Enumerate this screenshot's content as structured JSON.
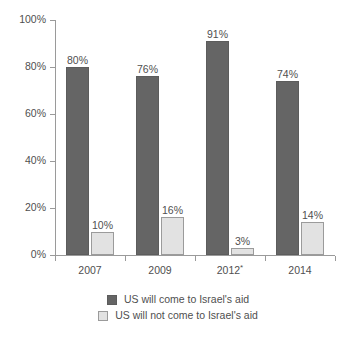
{
  "chart_data": {
    "type": "bar",
    "title": "",
    "subtitle": "",
    "xlabel": "",
    "ylabel": "",
    "ylim": [
      0,
      100
    ],
    "ytick_labels": [
      "0%",
      "20%",
      "40%",
      "60%",
      "80%",
      "100%"
    ],
    "ytick_values": [
      0,
      20,
      40,
      60,
      80,
      100
    ],
    "grid": false,
    "legend_position": "bottom",
    "categories": [
      "2007",
      "2009",
      "2012*",
      "2014"
    ],
    "series": [
      {
        "name": "US will come to Israel's aid",
        "color": "#656565",
        "values": [
          80,
          76,
          91,
          74
        ],
        "value_labels": [
          "80%",
          "76%",
          "91%",
          "74%"
        ]
      },
      {
        "name": "US will not come to Israel's aid",
        "color": "#e2e2e2",
        "values": [
          10,
          16,
          3,
          14
        ],
        "value_labels": [
          "10%",
          "16%",
          "3%",
          "14%"
        ]
      }
    ]
  },
  "legend": {
    "items": [
      {
        "label": "US will come to Israel's aid",
        "swatch": "dark"
      },
      {
        "label": "US will not come to Israel's aid",
        "swatch": "light"
      }
    ]
  },
  "colors": {
    "series_dark": "#656565",
    "series_light": "#e2e2e2",
    "axis": "#9a9a9a",
    "text": "#4f4f4f",
    "background": "#ffffff"
  }
}
